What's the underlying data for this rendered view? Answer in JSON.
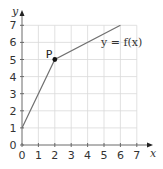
{
  "chart_data": {
    "type": "line",
    "title": "",
    "xlabel": "x",
    "ylabel": "y",
    "xlim": [
      0,
      7
    ],
    "ylim": [
      0,
      7
    ],
    "grid": true,
    "x_ticks": [
      0,
      1,
      2,
      3,
      4,
      5,
      6,
      7
    ],
    "y_ticks": [
      0,
      1,
      2,
      3,
      4,
      5,
      6,
      7
    ],
    "series": [
      {
        "name": "y = f(x)",
        "x": [
          0,
          2,
          6
        ],
        "y": [
          1,
          5,
          7
        ]
      }
    ],
    "annotations": [
      {
        "label": "P",
        "x": 2,
        "y": 5,
        "marker": "filled-dot"
      },
      {
        "label": "y = f(x)",
        "x": 4.8,
        "y": 6.1
      }
    ],
    "colors": {
      "line": "#707070",
      "axis": "#6a6a6a",
      "grid": "#d9d9d9",
      "point": "#111111"
    }
  },
  "labels": {
    "x_axis": "x",
    "y_axis": "y",
    "curve": "y = f(x)",
    "point": "P"
  }
}
